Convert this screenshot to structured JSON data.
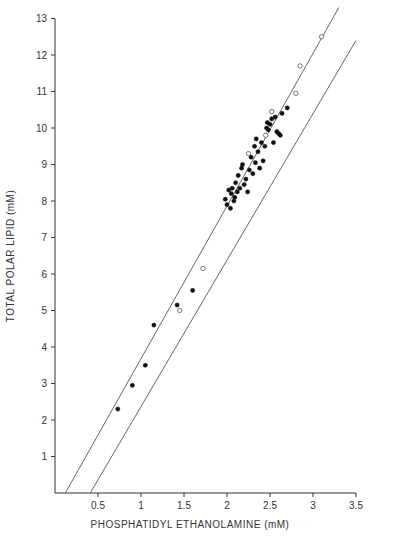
{
  "chart_data": {
    "type": "scatter",
    "title": "",
    "xlabel": "PHOSPHATIDYL ETHANOLAMINE  (mM)",
    "ylabel": "TOTAL POLAR LIPID  (mM)",
    "xlim": [
      0,
      3.5
    ],
    "ylim": [
      0,
      13
    ],
    "x_ticks": [
      0.5,
      1,
      1.5,
      2,
      2.5,
      3,
      3.5
    ],
    "x_tick_labels": [
      "0.5",
      "1",
      "1.5",
      "2",
      "2.5",
      "3",
      "3.5"
    ],
    "y_ticks": [
      1,
      2,
      3,
      4,
      5,
      6,
      7,
      8,
      9,
      10,
      11,
      12,
      13
    ],
    "y_tick_labels": [
      "1",
      "2",
      "3",
      "4",
      "5",
      "6",
      "7",
      "8",
      "9",
      "10",
      "11",
      "12",
      "13"
    ],
    "grid": false,
    "legend": null,
    "reference_lines": [
      {
        "name": "upper-bound",
        "x": [
          0.12,
          3.3
        ],
        "y": [
          0,
          13.3
        ]
      },
      {
        "name": "lower-bound",
        "x": [
          0.41,
          3.5
        ],
        "y": [
          0,
          12.4
        ]
      }
    ],
    "series": [
      {
        "name": "filled",
        "marker": "filled-circle",
        "points": [
          [
            0.73,
            2.3
          ],
          [
            0.9,
            2.95
          ],
          [
            1.05,
            3.5
          ],
          [
            1.15,
            4.6
          ],
          [
            1.42,
            5.15
          ],
          [
            1.6,
            5.55
          ],
          [
            1.98,
            8.05
          ],
          [
            2.0,
            7.9
          ],
          [
            2.02,
            8.3
          ],
          [
            2.04,
            7.8
          ],
          [
            2.05,
            8.2
          ],
          [
            2.06,
            8.35
          ],
          [
            2.08,
            8.0
          ],
          [
            2.09,
            8.1
          ],
          [
            2.1,
            8.5
          ],
          [
            2.12,
            8.25
          ],
          [
            2.13,
            8.7
          ],
          [
            2.15,
            8.35
          ],
          [
            2.17,
            8.9
          ],
          [
            2.18,
            9.0
          ],
          [
            2.2,
            8.45
          ],
          [
            2.22,
            8.6
          ],
          [
            2.24,
            8.25
          ],
          [
            2.26,
            8.85
          ],
          [
            2.28,
            9.2
          ],
          [
            2.3,
            8.75
          ],
          [
            2.32,
            9.5
          ],
          [
            2.33,
            9.05
          ],
          [
            2.34,
            9.7
          ],
          [
            2.36,
            9.35
          ],
          [
            2.38,
            8.9
          ],
          [
            2.4,
            9.6
          ],
          [
            2.42,
            9.1
          ],
          [
            2.44,
            9.5
          ],
          [
            2.46,
            10.0
          ],
          [
            2.47,
            10.15
          ],
          [
            2.48,
            9.95
          ],
          [
            2.5,
            10.1
          ],
          [
            2.52,
            10.25
          ],
          [
            2.54,
            9.6
          ],
          [
            2.56,
            10.3
          ],
          [
            2.58,
            9.9
          ],
          [
            2.6,
            9.85
          ],
          [
            2.62,
            9.8
          ],
          [
            2.64,
            10.4
          ],
          [
            2.7,
            10.55
          ]
        ]
      },
      {
        "name": "open",
        "marker": "open-circle",
        "points": [
          [
            1.45,
            5.0
          ],
          [
            1.72,
            6.15
          ],
          [
            2.25,
            9.3
          ],
          [
            2.45,
            9.8
          ],
          [
            2.52,
            10.45
          ],
          [
            2.8,
            10.95
          ],
          [
            2.85,
            11.7
          ],
          [
            3.1,
            12.5
          ]
        ]
      }
    ]
  }
}
